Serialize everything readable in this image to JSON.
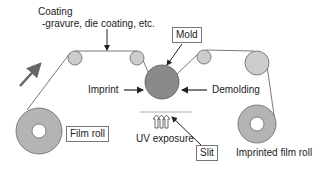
{
  "diagram": {
    "coating_title": "Coating",
    "coating_methods": "-gravure, die coating, etc.",
    "mold_label": "Mold",
    "imprint_label": "Imprint",
    "demolding_label": "Demolding",
    "film_roll_label": "Film roll",
    "uv_label": "UV exposure",
    "slit_label": "Slit",
    "imprinted_roll_label": "Imprinted film roll",
    "colors": {
      "roll_fill": "#b4b4b4",
      "mold_fill": "#8a8a8a",
      "roller_fill": "#cccccc",
      "line": "#444444",
      "arrow": "#222222"
    }
  }
}
